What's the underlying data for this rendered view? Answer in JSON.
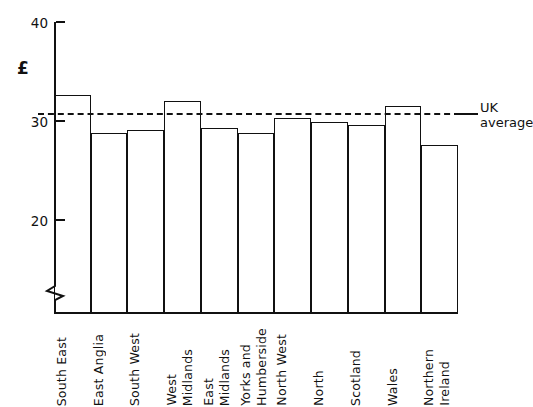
{
  "chart_data": {
    "type": "bar",
    "title": "",
    "subtitle": "",
    "xlabel": "",
    "ylabel": "£",
    "ylim": [
      20,
      40
    ],
    "y_axis_broken": true,
    "y_ticks": [
      20,
      30,
      40
    ],
    "y_tick_labels": [
      "20",
      "30",
      "40"
    ],
    "grid": false,
    "legend_position": "right-inline",
    "categories": [
      "South East",
      "East Anglia",
      "South West",
      "West Midlands",
      "East Midlands",
      "Yorks and Humberside",
      "North West",
      "North",
      "Scotland",
      "Wales",
      "Northern Ireland"
    ],
    "category_lines": [
      [
        "South East"
      ],
      [
        "East Anglia"
      ],
      [
        "South West"
      ],
      [
        "West",
        "Midlands"
      ],
      [
        "East",
        "Midlands"
      ],
      [
        "Yorks and",
        "Humberside"
      ],
      [
        "North West"
      ],
      [
        "North"
      ],
      [
        "Scotland"
      ],
      [
        "Wales"
      ],
      [
        "Northern",
        "Ireland"
      ]
    ],
    "values": [
      32.6,
      28.8,
      29.1,
      32.0,
      29.3,
      28.8,
      30.3,
      29.9,
      29.6,
      31.5,
      27.6
    ],
    "annotations": [
      {
        "name": "uk-average",
        "label_lines": [
          "UK",
          "average"
        ],
        "value": 30.8,
        "style": "dashed"
      }
    ],
    "colors": {
      "line": "#111111",
      "bar_fill": "#ffffff",
      "background": "#ffffff"
    }
  }
}
